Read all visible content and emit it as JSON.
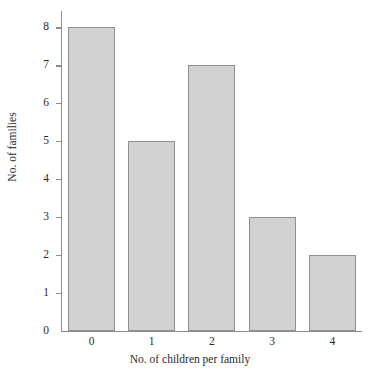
{
  "chart_data": {
    "type": "bar",
    "title": "",
    "subtitle": "",
    "xlabel": "No. of children per family",
    "ylabel": "No. of families",
    "categories": [
      "0",
      "1",
      "2",
      "3",
      "4"
    ],
    "values": [
      8,
      5,
      7,
      3,
      2
    ],
    "series": [
      {
        "name": "No. of families",
        "values": [
          8,
          5,
          7,
          3,
          2
        ]
      }
    ],
    "xlim": [
      -0.5,
      4.5
    ],
    "ylim": [
      0,
      8
    ],
    "ytick_labels": [
      "0",
      "1",
      "2",
      "3",
      "4",
      "5",
      "6",
      "7",
      "8"
    ],
    "ytick_values": [
      0,
      1,
      2,
      3,
      4,
      5,
      6,
      7,
      8
    ],
    "xtick_labels": [
      "0",
      "1",
      "2",
      "3",
      "4"
    ],
    "grid": false,
    "legend": false,
    "legend_position": "none",
    "annotations": [],
    "colors": {
      "bar_fill": "#d2d2d2",
      "bar_border": "#8f8f8f",
      "axis": "#8d8d8d",
      "text": "#2b2b2b",
      "background": "#ffffff"
    }
  }
}
